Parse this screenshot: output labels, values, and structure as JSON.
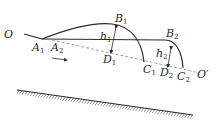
{
  "labels": {
    "O": "O",
    "O_prime": "O′",
    "A1": {
      "main": "A",
      "sub": "1"
    },
    "A2": {
      "main": "A",
      "sub": "2"
    },
    "B1": {
      "main": "B",
      "sub": "1"
    },
    "B2": {
      "main": "B",
      "sub": "2"
    },
    "C1": {
      "main": "C",
      "sub": "1"
    },
    "C2": {
      "main": "C",
      "sub": "2"
    },
    "D1": {
      "main": "D",
      "sub": "1"
    },
    "D2": {
      "main": "D",
      "sub": "2"
    },
    "h1": {
      "main": "h",
      "sub": "1"
    },
    "h2": {
      "main": "h",
      "sub": "2"
    }
  },
  "colors": {
    "stroke": "#2a2a2a",
    "dashed": "#7a7a7a",
    "background": "#ffffff"
  }
}
